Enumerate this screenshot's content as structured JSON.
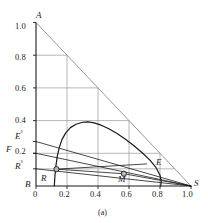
{
  "figure": {
    "caption": "(a)",
    "header_faint": "",
    "colors": {
      "axis": "#1a1a1a",
      "grid": "#9a9a9a",
      "hypotenuse": "#8c8c8c",
      "curve": "#1a1a1a",
      "tieline": "#1a1a1a",
      "marker_fill": "#b9b9b9",
      "marker_stroke": "#1a1a1a",
      "background": "#ffffff"
    }
  },
  "chart_data": {
    "type": "line",
    "title": "",
    "subtitle": "",
    "xlabel": "",
    "ylabel": "",
    "xlim": [
      0,
      1.05
    ],
    "ylim": [
      0,
      1.05
    ],
    "grid": true,
    "legend": "none",
    "x_ticks": [
      "0",
      "0.2",
      "0.4",
      "0.6",
      "0.8",
      "1.0"
    ],
    "x_tick_values": [
      0,
      0.2,
      0.4,
      0.6,
      0.8,
      1.0
    ],
    "y_ticks": [
      "0.2",
      "0.4",
      "0.6",
      "0.8",
      "1.0"
    ],
    "y_tick_values": [
      0.2,
      0.4,
      0.6,
      0.8,
      1.0
    ],
    "vertex_labels": [
      {
        "name": "A",
        "x": 0.0,
        "y": 1.0
      },
      {
        "name": "B",
        "x": 0.0,
        "y": 0.0
      },
      {
        "name": "S",
        "x": 1.0,
        "y": 0.0
      }
    ],
    "axis_point_labels": [
      {
        "name": "E",
        "sup": "°",
        "x": 0.0,
        "y": 0.272
      },
      {
        "name": "F",
        "sup": "",
        "x": 0.0,
        "y": 0.2
      },
      {
        "name": "R",
        "sup": "°",
        "x": 0.0,
        "y": 0.105
      }
    ],
    "interior_points": [
      {
        "name": "R",
        "x": 0.132,
        "y": 0.103,
        "marker": "circle"
      },
      {
        "name": "M",
        "x": 0.567,
        "y": 0.075,
        "marker": "circle"
      },
      {
        "name": "E",
        "x": 0.715,
        "y": 0.135,
        "marker": "none"
      }
    ],
    "series": [
      {
        "name": "binodal-dome",
        "kind": "curve",
        "points": [
          [
            0.118,
            0.0
          ],
          [
            0.122,
            0.06
          ],
          [
            0.128,
            0.12
          ],
          [
            0.137,
            0.18
          ],
          [
            0.15,
            0.235
          ],
          [
            0.168,
            0.285
          ],
          [
            0.192,
            0.325
          ],
          [
            0.222,
            0.357
          ],
          [
            0.258,
            0.378
          ],
          [
            0.3,
            0.39
          ],
          [
            0.335,
            0.392
          ],
          [
            0.375,
            0.386
          ],
          [
            0.42,
            0.372
          ],
          [
            0.47,
            0.35
          ],
          [
            0.52,
            0.322
          ],
          [
            0.575,
            0.288
          ],
          [
            0.63,
            0.248
          ],
          [
            0.685,
            0.203
          ],
          [
            0.735,
            0.158
          ],
          [
            0.775,
            0.112
          ],
          [
            0.8,
            0.066
          ],
          [
            0.808,
            0.028
          ],
          [
            0.805,
            0.0
          ]
        ]
      },
      {
        "name": "hypotenuse-AS",
        "kind": "line",
        "points": [
          [
            0.0,
            1.0
          ],
          [
            1.0,
            0.0
          ]
        ]
      },
      {
        "name": "tie-line-E0-S",
        "kind": "line",
        "points": [
          [
            0.0,
            0.272
          ],
          [
            1.0,
            0.0
          ]
        ]
      },
      {
        "name": "tie-line-F-S",
        "kind": "line",
        "points": [
          [
            0.0,
            0.2
          ],
          [
            1.0,
            0.0
          ]
        ]
      },
      {
        "name": "tie-line-R0-R-M-E-S",
        "kind": "line",
        "points": [
          [
            0.0,
            0.105
          ],
          [
            1.0,
            0.0
          ]
        ]
      },
      {
        "name": "tie-line-R-M",
        "kind": "line",
        "points": [
          [
            0.132,
            0.103
          ],
          [
            0.567,
            0.075
          ]
        ]
      },
      {
        "name": "tie-line-M-S",
        "kind": "line",
        "points": [
          [
            0.567,
            0.075
          ],
          [
            1.0,
            0.0
          ]
        ]
      },
      {
        "name": "tie-line-R-E",
        "kind": "line",
        "points": [
          [
            0.132,
            0.103
          ],
          [
            0.715,
            0.135
          ]
        ]
      }
    ],
    "grid_lines": [
      {
        "y": 0.8,
        "x_end": 0.2
      },
      {
        "y": 0.6,
        "x_end": 0.4
      },
      {
        "y": 0.4,
        "x_end": 0.6
      },
      {
        "y": 0.2,
        "x_end": 0.8
      },
      {
        "y": 0.105,
        "x_end": 0.895
      }
    ],
    "vertical_grid_lines": [
      {
        "x": 0.2,
        "y_top": 0.8
      },
      {
        "x": 0.4,
        "y_top": 0.6
      },
      {
        "x": 0.6,
        "y_top": 0.4
      },
      {
        "x": 0.8,
        "y_top": 0.2
      }
    ]
  }
}
